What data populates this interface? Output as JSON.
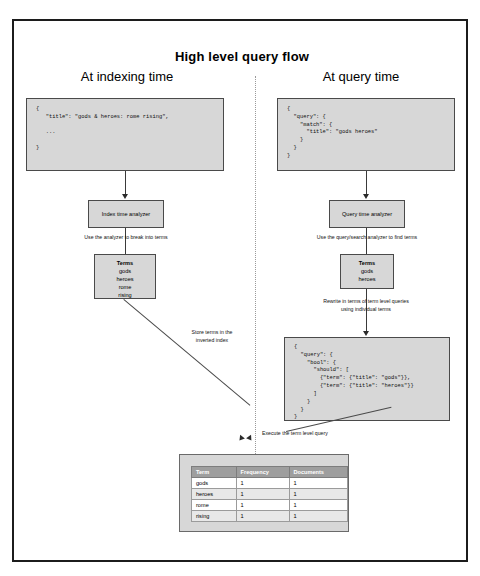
{
  "diagram": {
    "title": "High level query flow",
    "left_column": {
      "heading": "At indexing time",
      "source_doc": "{\n   \"title\": \"gods & heroes: rome rising\",\n\n   ...\n\n}",
      "analyzer_box": "Index time analyzer",
      "analyzer_caption": "Use the analyzer to break into terms",
      "terms_title": "Terms",
      "terms": [
        "gods",
        "heroes",
        "rome",
        "rising"
      ],
      "store_caption": "Store terms in the\ninverted index"
    },
    "right_column": {
      "heading": "At query time",
      "source_query": "{\n  \"query\": {\n    \"match\": {\n      \"title\": \"gods heroes\"\n    }\n  }\n}",
      "analyzer_box": "Query time analyzer",
      "analyzer_caption": "Use the query/search analyzer to find terms",
      "terms_title": "Terms",
      "terms": [
        "gods",
        "heroes"
      ],
      "rewrite_caption": "Rewrite in terms of term level queries\nusing individual terms",
      "term_query": "{\n  \"query\": {\n    \"bool\": {\n      \"should\": [\n        {\"term\": {\"title\": \"gods\"}},\n        {\"term\": {\"title\": \"heroes\"}}\n      ]\n    }\n  }\n}",
      "execute_caption": "Execute the term level query"
    },
    "inverted_index_table": {
      "columns": [
        "Term",
        "Frequency",
        "Documents"
      ],
      "rows": [
        [
          "gods",
          "1",
          "1"
        ],
        [
          "heroes",
          "1",
          "1"
        ],
        [
          "rome",
          "1",
          "1"
        ],
        [
          "rising",
          "1",
          "1"
        ]
      ]
    },
    "colors": {
      "box_fill": "#d7d7d7",
      "box_border": "#4a4a4a",
      "frame_border": "#1c1c1c",
      "table_header": "#9e9e9e"
    }
  }
}
